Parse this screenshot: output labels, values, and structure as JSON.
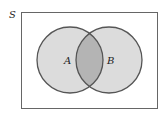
{
  "diagram": {
    "type": "venn",
    "universe_label": "S",
    "sets": [
      {
        "label": "A",
        "fill": "#dcdcdc"
      },
      {
        "label": "B",
        "fill": "#dcdcdc"
      }
    ],
    "intersection_fill": "#b4b4b4",
    "stroke_color": "#555555",
    "border_color": "#666666"
  }
}
